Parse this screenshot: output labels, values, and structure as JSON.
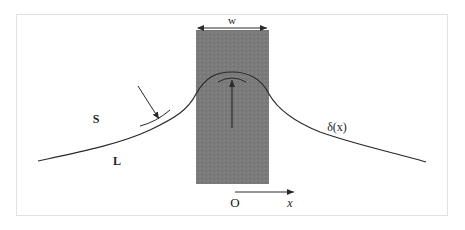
{
  "diagram": {
    "labels": {
      "width": "w",
      "solid_phase": "S",
      "liquid_phase": "L",
      "profile": "δ(x)",
      "origin": "O",
      "axis": "x"
    },
    "colors": {
      "background": "#ffffff",
      "frame_border": "#e2e2e2",
      "band_fill": "#7a7a7a",
      "curve": "#2a2a2a",
      "text": "#222222"
    }
  }
}
